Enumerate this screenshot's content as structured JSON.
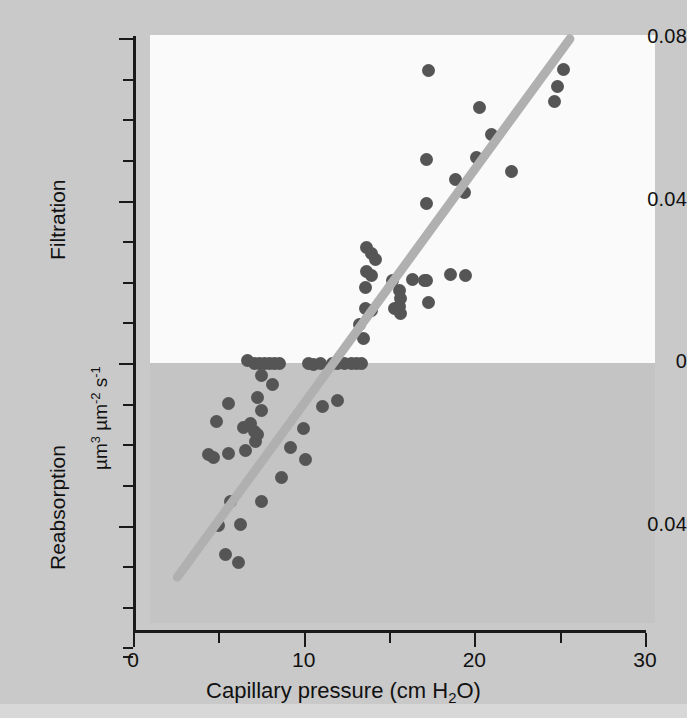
{
  "chart_data": {
    "type": "scatter",
    "title": "",
    "xlabel": "Capillary pressure (cm H2O)",
    "ylabel": "µm3 µm-2 s-1",
    "ylabel_upper_region": "Filtration",
    "ylabel_lower_region": "Reabsorption",
    "xlim": [
      0,
      30
    ],
    "ylim": [
      -0.072,
      0.08
    ],
    "grid": false,
    "legend": "none",
    "xticks_major": [
      0,
      10,
      20,
      30
    ],
    "xticks_major_labels": [
      "0",
      "10",
      "20",
      "30"
    ],
    "xticks_minor": [
      5,
      15,
      25
    ],
    "yticks_major": [
      0.08,
      0.04,
      0,
      -0.04
    ],
    "yticks_major_labels": [
      "0.08",
      "0.04",
      "0",
      "0.04"
    ],
    "yticks_minor": [
      0.07,
      0.06,
      0.05,
      0.03,
      0.02,
      0.01,
      -0.01,
      -0.02,
      -0.03,
      -0.05,
      -0.06,
      -0.07
    ],
    "point_color": "#555555",
    "line_color": "#b0b0b0",
    "panel_upper_color": "#fafafa",
    "panel_lower_color": "#c4c4c4",
    "background_color": "#c9c9c9",
    "axis_color": "#1a1a1a",
    "regression_line": {
      "x_start": 2.6,
      "y_start": -0.0527,
      "x_end": 25.6,
      "y_end": 0.0798
    },
    "points": [
      [
        13.7,
        0.0285
      ],
      [
        14.0,
        0.027
      ],
      [
        14.2,
        0.0255
      ],
      [
        13.7,
        0.0225
      ],
      [
        14.0,
        0.0215
      ],
      [
        13.6,
        0.0185
      ],
      [
        13.6,
        0.0135
      ],
      [
        14.0,
        0.013
      ],
      [
        13.3,
        0.0095
      ],
      [
        13.5,
        0.006
      ],
      [
        15.6,
        0.0178
      ],
      [
        15.7,
        0.016
      ],
      [
        15.6,
        0.014
      ],
      [
        15.7,
        0.0122
      ],
      [
        15.2,
        0.0202
      ],
      [
        16.4,
        0.0205
      ],
      [
        17.1,
        0.0203
      ],
      [
        15.3,
        0.0133
      ],
      [
        17.2,
        0.0203
      ],
      [
        17.3,
        0.0148
      ],
      [
        18.6,
        0.0218
      ],
      [
        19.5,
        0.0215
      ],
      [
        17.3,
        0.072
      ],
      [
        17.2,
        0.05
      ],
      [
        17.2,
        0.0393
      ],
      [
        18.9,
        0.0452
      ],
      [
        19.4,
        0.042
      ],
      [
        20.1,
        0.0505
      ],
      [
        20.3,
        0.0628
      ],
      [
        21.0,
        0.0563
      ],
      [
        22.2,
        0.0472
      ],
      [
        24.7,
        0.0643
      ],
      [
        24.9,
        0.068
      ],
      [
        25.2,
        0.0722
      ],
      [
        6.7,
        0.0005
      ],
      [
        7.1,
        0.0
      ],
      [
        7.4,
        0.0
      ],
      [
        7.7,
        0.0
      ],
      [
        8.0,
        0.0
      ],
      [
        8.3,
        -0.0002
      ],
      [
        8.6,
        0.0
      ],
      [
        10.3,
        0.0
      ],
      [
        10.6,
        -0.0004
      ],
      [
        11.0,
        0.0
      ],
      [
        11.7,
        0.0
      ],
      [
        12.0,
        0.0
      ],
      [
        12.4,
        0.0
      ],
      [
        12.8,
        0.0
      ],
      [
        13.1,
        0.0
      ],
      [
        13.4,
        0.0
      ],
      [
        7.5,
        -0.003
      ],
      [
        8.2,
        -0.0053
      ],
      [
        5.6,
        -0.01
      ],
      [
        7.3,
        -0.0085
      ],
      [
        7.5,
        -0.0118
      ],
      [
        11.1,
        -0.0108
      ],
      [
        12.0,
        -0.0092
      ],
      [
        4.9,
        -0.0145
      ],
      [
        6.5,
        -0.0158
      ],
      [
        6.9,
        -0.015
      ],
      [
        7.1,
        -0.0168
      ],
      [
        7.3,
        -0.0175
      ],
      [
        7.2,
        -0.0192
      ],
      [
        10.0,
        -0.016
      ],
      [
        4.4,
        -0.0225
      ],
      [
        4.7,
        -0.0232
      ],
      [
        5.6,
        -0.0222
      ],
      [
        6.6,
        -0.0215
      ],
      [
        9.2,
        -0.0208
      ],
      [
        10.1,
        -0.0238
      ],
      [
        8.7,
        -0.0283
      ],
      [
        5.7,
        -0.0342
      ],
      [
        7.5,
        -0.034
      ],
      [
        5.0,
        -0.04
      ],
      [
        6.3,
        -0.0398
      ],
      [
        5.4,
        -0.0472
      ],
      [
        6.2,
        -0.0492
      ]
    ]
  },
  "axis": {
    "x_title_parts": {
      "pre": "Capillary pressure (cm H",
      "sub": "2",
      "post": "O)"
    },
    "y_unit_parts": {
      "a": "µm",
      "a_sup": "3",
      "b": " µm",
      "b_sup": "-2",
      "c": " s",
      "c_sup": "-1"
    },
    "filtration_label": "Filtration",
    "reabsorption_label": "Reabsorption"
  }
}
